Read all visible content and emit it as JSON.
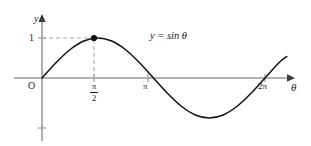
{
  "figure": {
    "background_color": "#ffffff",
    "width": 311,
    "height": 146
  },
  "axes": {
    "x_axis": {
      "label": "θ",
      "color": "#9a9a9a",
      "arrow": true
    },
    "y_axis": {
      "label": "y",
      "color": "#9a9a9a",
      "arrow": true
    },
    "origin_label": "O"
  },
  "ticks": {
    "y": [
      {
        "label": "1",
        "value": 1
      },
      {
        "label": "",
        "value": -1
      }
    ],
    "x": [
      {
        "label": "π/2",
        "numerator": "π",
        "denominator": "2",
        "value": 1.5708
      },
      {
        "label": "π",
        "value": 3.1416
      },
      {
        "label": "2π",
        "value": 6.2832
      }
    ]
  },
  "annotations": {
    "equation": "y = sin θ",
    "peak_point": {
      "x": "π/2",
      "y": "1",
      "marker": "filled-circle",
      "color": "#111111"
    },
    "guide_lines": {
      "style": "dashed",
      "color": "#aaaaaa"
    }
  },
  "chart_data": {
    "type": "line",
    "title": "",
    "subtitle": "",
    "xlabel": "θ",
    "ylabel": "y",
    "xlim": [
      0,
      7.0
    ],
    "ylim": [
      -1.25,
      1.25
    ],
    "grid": false,
    "legend": null,
    "xticks": [
      {
        "value": 0,
        "label": "O"
      },
      {
        "value": 1.5708,
        "label": "π/2"
      },
      {
        "value": 3.1416,
        "label": "π"
      },
      {
        "value": 6.2832,
        "label": "2π"
      }
    ],
    "yticks": [
      {
        "value": 1,
        "label": "1"
      },
      {
        "value": -1,
        "label": ""
      }
    ],
    "series": [
      {
        "name": "y = sin θ",
        "color": "#111111",
        "x": [
          0,
          0.3927,
          0.7854,
          1.1781,
          1.5708,
          1.9635,
          2.3562,
          2.7489,
          3.1416,
          3.5343,
          3.927,
          4.3197,
          4.7124,
          5.1051,
          5.4978,
          5.8905,
          6.2832,
          6.6759,
          6.9
        ],
        "y": [
          0,
          0.3827,
          0.7071,
          0.9239,
          1.0,
          0.9239,
          0.7071,
          0.3827,
          0,
          -0.3827,
          -0.7071,
          -0.9239,
          -1.0,
          -0.9239,
          -0.7071,
          -0.3827,
          0,
          0.3827,
          0.5373
        ]
      }
    ],
    "annotations": [
      {
        "type": "point",
        "x": 1.5708,
        "y": 1.0,
        "label": "",
        "marker": "filled-circle"
      },
      {
        "type": "text",
        "x": 2.4,
        "y": 1.05,
        "label": "y = sin θ"
      },
      {
        "type": "guide-line",
        "from": [
          0,
          1.0
        ],
        "to": [
          1.5708,
          1.0
        ],
        "style": "dashed"
      },
      {
        "type": "guide-line",
        "from": [
          1.5708,
          1.0
        ],
        "to": [
          1.5708,
          0
        ],
        "style": "dashed"
      }
    ]
  }
}
